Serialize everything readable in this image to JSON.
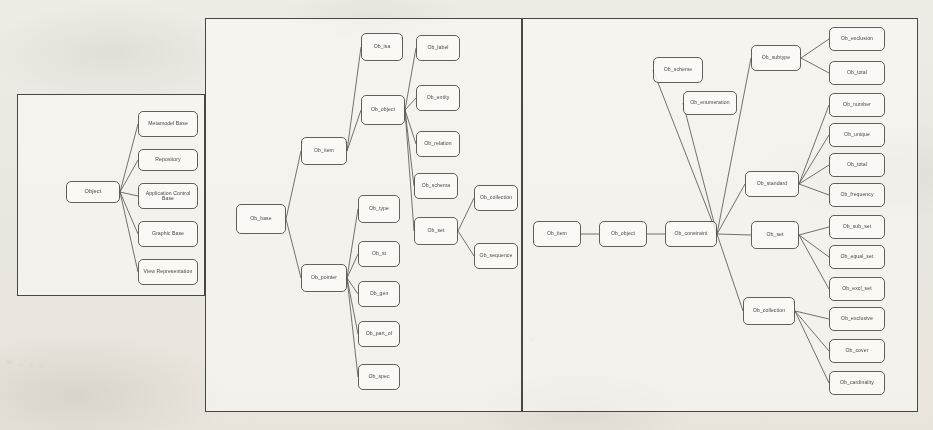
{
  "document": {
    "type": "scanned-diagram-page",
    "panel_count": 3,
    "ink_color": "#4f4c47",
    "paper_color": "#ece9e2"
  },
  "panels": [
    {
      "id": "panel-left",
      "name": "object-classification-panel",
      "root": "Object",
      "nodes": [
        {
          "id": "l0",
          "label": "Object",
          "x": 48,
          "y": 86,
          "w": 54,
          "h": 22,
          "size": "md"
        },
        {
          "id": "l1",
          "label": "Metamodel Base",
          "x": 120,
          "y": 16,
          "w": 60,
          "h": 26,
          "size": "sm"
        },
        {
          "id": "l2",
          "label": "Repository",
          "x": 120,
          "y": 54,
          "w": 60,
          "h": 22,
          "size": "sm"
        },
        {
          "id": "l3",
          "label": "Application Control Base",
          "x": 120,
          "y": 88,
          "w": 60,
          "h": 26,
          "size": "sm"
        },
        {
          "id": "l4",
          "label": "Graphic Base",
          "x": 120,
          "y": 126,
          "w": 60,
          "h": 26,
          "size": "sm"
        },
        {
          "id": "l5",
          "label": "View Representation",
          "x": 120,
          "y": 164,
          "w": 60,
          "h": 26,
          "size": "sm"
        }
      ],
      "edges": [
        [
          "l0",
          "l1"
        ],
        [
          "l0",
          "l2"
        ],
        [
          "l0",
          "l3"
        ],
        [
          "l0",
          "l4"
        ],
        [
          "l0",
          "l5"
        ]
      ]
    },
    {
      "id": "panel-mid",
      "name": "ob-base-tree-panel",
      "root": "Ob_base",
      "nodes": [
        {
          "id": "m0",
          "label": "Ob_base",
          "x": 30,
          "y": 185,
          "w": 50,
          "h": 30,
          "size": "sm"
        },
        {
          "id": "m1",
          "label": "Ob_item",
          "x": 95,
          "y": 118,
          "w": 46,
          "h": 28,
          "size": "sm"
        },
        {
          "id": "m2",
          "label": "Ob_pointer",
          "x": 95,
          "y": 245,
          "w": 46,
          "h": 28,
          "size": "sm"
        },
        {
          "id": "m3",
          "label": "Ob_isa",
          "x": 155,
          "y": 14,
          "w": 42,
          "h": 28,
          "size": "sm"
        },
        {
          "id": "m4",
          "label": "Ob_object",
          "x": 155,
          "y": 76,
          "w": 44,
          "h": 30,
          "size": "sm"
        },
        {
          "id": "m5",
          "label": "Ob_type",
          "x": 152,
          "y": 176,
          "w": 42,
          "h": 28,
          "size": "sm"
        },
        {
          "id": "m6",
          "label": "Ob_st",
          "x": 152,
          "y": 222,
          "w": 42,
          "h": 26,
          "size": "sm"
        },
        {
          "id": "m7",
          "label": "Ob_gen",
          "x": 152,
          "y": 262,
          "w": 42,
          "h": 26,
          "size": "sm"
        },
        {
          "id": "m8",
          "label": "Ob_part_of",
          "x": 152,
          "y": 302,
          "w": 42,
          "h": 26,
          "size": "sm"
        },
        {
          "id": "m9",
          "label": "Ob_spec",
          "x": 152,
          "y": 345,
          "w": 42,
          "h": 26,
          "size": "sm"
        },
        {
          "id": "m10",
          "label": "Ob_label",
          "x": 210,
          "y": 16,
          "w": 44,
          "h": 26,
          "size": "sm"
        },
        {
          "id": "m11",
          "label": "Ob_entity",
          "x": 210,
          "y": 66,
          "w": 44,
          "h": 26,
          "size": "sm"
        },
        {
          "id": "m12",
          "label": "Ob_relation",
          "x": 210,
          "y": 112,
          "w": 44,
          "h": 26,
          "size": "sm"
        },
        {
          "id": "m13",
          "label": "Ob_schema",
          "x": 208,
          "y": 154,
          "w": 44,
          "h": 26,
          "size": "sm"
        },
        {
          "id": "m14",
          "label": "Ob_set",
          "x": 208,
          "y": 198,
          "w": 44,
          "h": 28,
          "size": "sm"
        },
        {
          "id": "m15",
          "label": "Ob_collection",
          "x": 268,
          "y": 166,
          "w": 44,
          "h": 26,
          "size": "sm"
        },
        {
          "id": "m16",
          "label": "Ob_sequence",
          "x": 268,
          "y": 224,
          "w": 44,
          "h": 26,
          "size": "sm"
        }
      ],
      "edges": [
        [
          "m0",
          "m1"
        ],
        [
          "m0",
          "m2"
        ],
        [
          "m1",
          "m3"
        ],
        [
          "m1",
          "m4"
        ],
        [
          "m2",
          "m5"
        ],
        [
          "m2",
          "m6"
        ],
        [
          "m2",
          "m7"
        ],
        [
          "m2",
          "m8"
        ],
        [
          "m2",
          "m9"
        ],
        [
          "m4",
          "m10"
        ],
        [
          "m4",
          "m11"
        ],
        [
          "m4",
          "m12"
        ],
        [
          "m4",
          "m13"
        ],
        [
          "m4",
          "m14"
        ],
        [
          "m14",
          "m15"
        ],
        [
          "m14",
          "m16"
        ]
      ]
    },
    {
      "id": "panel-right",
      "name": "ob-constraint-tree-panel",
      "root": "Ob_item",
      "nodes": [
        {
          "id": "r0",
          "label": "Ob_item",
          "x": 10,
          "y": 202,
          "w": 48,
          "h": 26,
          "size": "sm"
        },
        {
          "id": "r1",
          "label": "Ob_object",
          "x": 76,
          "y": 202,
          "w": 48,
          "h": 26,
          "size": "sm"
        },
        {
          "id": "r2",
          "label": "Ob_constraint",
          "x": 142,
          "y": 202,
          "w": 52,
          "h": 26,
          "size": "sm"
        },
        {
          "id": "r3",
          "label": "Ob_scheme",
          "x": 130,
          "y": 38,
          "w": 50,
          "h": 26,
          "size": "sm"
        },
        {
          "id": "r4",
          "label": "Ob_enumeration",
          "x": 160,
          "y": 72,
          "w": 54,
          "h": 24,
          "size": "sm"
        },
        {
          "id": "r5",
          "label": "Ob_subtype",
          "x": 228,
          "y": 26,
          "w": 50,
          "h": 26,
          "size": "sm"
        },
        {
          "id": "r6",
          "label": "Ob_standard",
          "x": 222,
          "y": 152,
          "w": 54,
          "h": 26,
          "size": "sm"
        },
        {
          "id": "r7",
          "label": "Ob_set",
          "x": 228,
          "y": 202,
          "w": 48,
          "h": 28,
          "size": "sm"
        },
        {
          "id": "r8",
          "label": "Ob_collection",
          "x": 220,
          "y": 278,
          "w": 52,
          "h": 28,
          "size": "sm"
        },
        {
          "id": "r9",
          "label": "Ob_exclusion",
          "x": 306,
          "y": 8,
          "w": 56,
          "h": 24,
          "size": "sm"
        },
        {
          "id": "r10",
          "label": "Ob_total",
          "x": 306,
          "y": 42,
          "w": 56,
          "h": 24,
          "size": "sm"
        },
        {
          "id": "r11",
          "label": "Ob_number",
          "x": 306,
          "y": 74,
          "w": 56,
          "h": 24,
          "size": "sm"
        },
        {
          "id": "r12",
          "label": "Ob_unique",
          "x": 306,
          "y": 104,
          "w": 56,
          "h": 24,
          "size": "sm"
        },
        {
          "id": "r13",
          "label": "Ob_total",
          "x": 306,
          "y": 134,
          "w": 56,
          "h": 24,
          "size": "sm"
        },
        {
          "id": "r14",
          "label": "Ob_frequency",
          "x": 306,
          "y": 164,
          "w": 56,
          "h": 24,
          "size": "sm"
        },
        {
          "id": "r15",
          "label": "Ob_sub_set",
          "x": 306,
          "y": 196,
          "w": 56,
          "h": 24,
          "size": "sm"
        },
        {
          "id": "r16",
          "label": "Ob_equal_set",
          "x": 306,
          "y": 226,
          "w": 56,
          "h": 24,
          "size": "sm"
        },
        {
          "id": "r17",
          "label": "Ob_excl_set",
          "x": 306,
          "y": 258,
          "w": 56,
          "h": 24,
          "size": "sm"
        },
        {
          "id": "r18",
          "label": "Ob_exclusive",
          "x": 306,
          "y": 288,
          "w": 56,
          "h": 24,
          "size": "sm"
        },
        {
          "id": "r19",
          "label": "Ob_cover",
          "x": 306,
          "y": 320,
          "w": 56,
          "h": 24,
          "size": "sm"
        },
        {
          "id": "r20",
          "label": "Ob_cardinality",
          "x": 306,
          "y": 352,
          "w": 56,
          "h": 24,
          "size": "sm"
        }
      ],
      "edges": [
        [
          "r0",
          "r1"
        ],
        [
          "r1",
          "r2"
        ],
        [
          "r2",
          "r3"
        ],
        [
          "r2",
          "r4"
        ],
        [
          "r2",
          "r5"
        ],
        [
          "r2",
          "r6"
        ],
        [
          "r2",
          "r7"
        ],
        [
          "r2",
          "r8"
        ],
        [
          "r5",
          "r9"
        ],
        [
          "r5",
          "r10"
        ],
        [
          "r6",
          "r11"
        ],
        [
          "r6",
          "r12"
        ],
        [
          "r6",
          "r13"
        ],
        [
          "r6",
          "r14"
        ],
        [
          "r7",
          "r15"
        ],
        [
          "r7",
          "r16"
        ],
        [
          "r7",
          "r17"
        ],
        [
          "r8",
          "r18"
        ],
        [
          "r8",
          "r19"
        ],
        [
          "r8",
          "r20"
        ]
      ]
    }
  ],
  "artifacts": {
    "smudges": [
      {
        "text": "~ . . .",
        "x": 6,
        "y": 356
      },
      {
        "text": ". .",
        "x": 520,
        "y": 330
      }
    ]
  }
}
